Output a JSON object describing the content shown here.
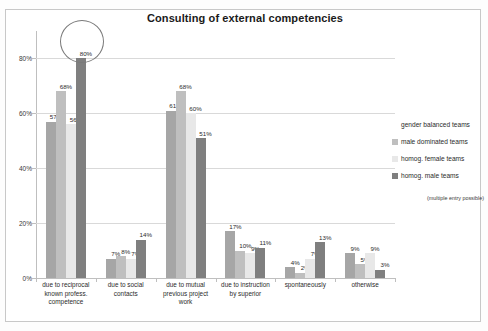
{
  "chart_data": {
    "type": "bar",
    "title": "Consulting of external competencies",
    "xlabel": "",
    "ylabel": "",
    "ylim": [
      0,
      90
    ],
    "grid": true,
    "legend_position": "right",
    "ytick_labels": [
      "0%",
      "20%",
      "40%",
      "60%",
      "80%"
    ],
    "ytick_values": [
      0,
      20,
      40,
      60,
      80
    ],
    "categories": [
      "due to reciprocal known profess. competence",
      "due to social contacts",
      "due to mutual previous project work",
      "due to instruction by superior",
      "spontaneously",
      "otherwise"
    ],
    "category_lines": [
      [
        "due to reciprocal",
        "known profess.",
        "competence"
      ],
      [
        "due to social",
        "contacts"
      ],
      [
        "due to mutual",
        "previous project",
        "work"
      ],
      [
        "due to instruction",
        "by superior"
      ],
      [
        "spontaneously"
      ],
      [
        "otherwise"
      ]
    ],
    "series": [
      {
        "name": "gender balanced teams",
        "color": "#a6a6a6",
        "values": [
          57,
          7,
          61,
          17,
          4,
          9
        ],
        "labels": [
          "57%",
          "7%",
          "61%",
          "17%",
          "4%",
          "9%"
        ]
      },
      {
        "name": "male dominated teams",
        "color": "#bfbfbf",
        "values": [
          68,
          8,
          68,
          10,
          2,
          5
        ],
        "labels": [
          "68%",
          "8%",
          "68%",
          "10%",
          "2%",
          "5%"
        ]
      },
      {
        "name": "homog. female teams",
        "color": "#e8e8e8",
        "values": [
          56,
          7,
          60,
          9,
          7,
          9
        ],
        "labels": [
          "56%",
          "7%",
          "60%",
          "9%",
          "7%",
          "9%"
        ]
      },
      {
        "name": "homog. male teams",
        "color": "#7f7f7f",
        "values": [
          80,
          14,
          51,
          11,
          13,
          3
        ],
        "labels": [
          "80%",
          "14%",
          "51%",
          "11%",
          "13%",
          "3%"
        ]
      }
    ],
    "annotations": [
      {
        "kind": "ellipse-highlight",
        "target_series": "homog. male teams",
        "target_category": "due to reciprocal known profess. competence",
        "target_value": 80
      }
    ],
    "note": "(multiple entry possible)"
  }
}
